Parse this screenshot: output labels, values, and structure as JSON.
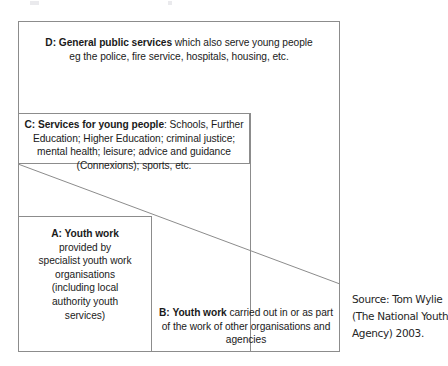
{
  "diagram": {
    "type": "nested-boxes",
    "line_color": "#8c8c8c",
    "text_color": "#1a1a1a",
    "background": "#ffffff",
    "boxes": [
      {
        "id": "D",
        "label_prefix": "D:",
        "bold_title": "General public services",
        "rest_line1": " which also serve young people",
        "line2": "eg the police, fire service, hospitals, housing, etc.",
        "role": "outermost frame"
      },
      {
        "id": "C",
        "label_prefix": "C:",
        "bold_title": "Services for young people",
        "rest_line1": ": Schools, Further",
        "line2": "Education; Higher Education; criminal justice;",
        "line3": "mental health; leisure; advice and guidance",
        "line4": "(Connexions); sports, etc.",
        "role": "second band"
      },
      {
        "id": "A",
        "label_prefix": "A:",
        "bold_title": "Youth work",
        "line2": "provided by",
        "line3": "specialist youth work",
        "line4": "organisations",
        "line5": "(including local",
        "line6": "authority youth",
        "line7": "services)",
        "role": "inner left box"
      },
      {
        "id": "B",
        "label_prefix": "B:",
        "bold_title": "Youth work",
        "rest_line1": " carried out in or as part",
        "line2": "of the work of other organisations and",
        "line3": "agencies",
        "role": "inner right region"
      }
    ],
    "diagonal": {
      "description": "sloping divider from left edge of box C down to right edge of outer frame",
      "x1": 18,
      "y1": 164,
      "x2": 340,
      "y2": 284
    }
  },
  "source": {
    "line1": "Source: Tom Wylie",
    "line2": "(The National Youth",
    "line3": "Agency) 2003."
  }
}
